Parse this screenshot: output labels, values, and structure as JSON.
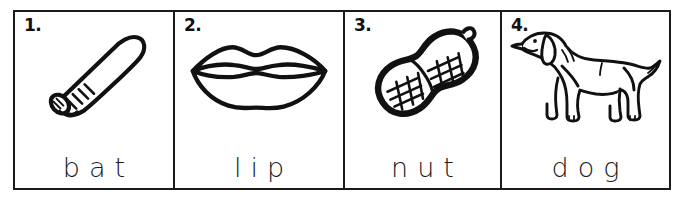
{
  "worksheet": {
    "title": "Picture-Word Matching Strip",
    "background_color": "#ffffff",
    "ink_color": "#1a1a1a",
    "border_color": "#1a1a1a"
  },
  "items": [
    {
      "number": "1.",
      "word": "bat",
      "picture_name": "baseball-bat-illustration",
      "picture_alt": "Line drawing of a baseball bat tilted diagonally with grip rings on the handle"
    },
    {
      "number": "2.",
      "word": "lip",
      "picture_name": "lips-illustration",
      "picture_alt": "Line drawing of a pair of lips"
    },
    {
      "number": "3.",
      "word": "nut",
      "picture_name": "peanut-illustration",
      "picture_alt": "Line drawing of a peanut in the shell with crosshatch texture"
    },
    {
      "number": "4.",
      "word": "dog",
      "picture_name": "dog-illustration",
      "picture_alt": "Line drawing of a dog standing in profile facing left"
    }
  ]
}
